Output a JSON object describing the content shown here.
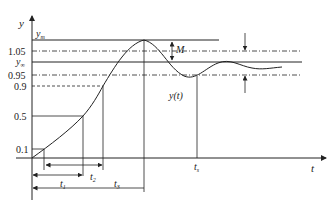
{
  "diagram": {
    "type": "step-response",
    "axes": {
      "y_label": "y",
      "x_label": "t"
    },
    "y_levels": [
      {
        "label": "y_m",
        "sub": "m",
        "base": "y",
        "meaning": "peak value",
        "style": "solid"
      },
      {
        "label": "1.05",
        "meaning": "upper 5% band",
        "style": "dash-dot"
      },
      {
        "label": "y_∞",
        "sub": "∞",
        "base": "y",
        "meaning": "steady-state value",
        "style": "solid"
      },
      {
        "label": "0.95",
        "meaning": "lower 5% band",
        "style": "dash-dot"
      },
      {
        "label": "0.9",
        "meaning": "90% level",
        "style": "dashed"
      },
      {
        "label": "0.5",
        "meaning": "50% level",
        "style": "solid"
      },
      {
        "label": "0.1",
        "meaning": "10% level",
        "style": "solid"
      }
    ],
    "annotations": {
      "overshoot": "M",
      "curve": "y(t)",
      "t1": {
        "base": "t",
        "sub": "1",
        "meaning": "delay time (0 to 0.5)"
      },
      "t2": {
        "base": "t",
        "sub": "2",
        "meaning": "rise time (0.1 to 0.9)"
      },
      "t3": {
        "base": "t",
        "sub": "3",
        "meaning": "peak time"
      },
      "t4": {
        "base": "t",
        "sub": "s",
        "meaning": "settling time"
      }
    }
  }
}
